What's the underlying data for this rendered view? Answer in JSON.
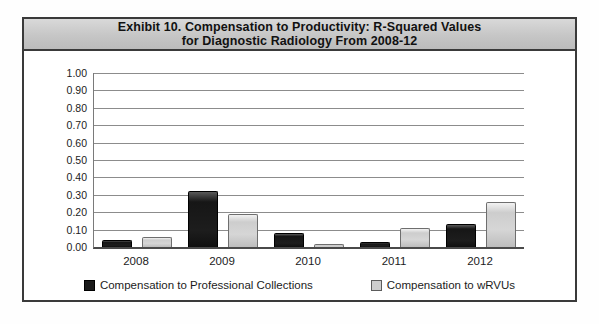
{
  "title": {
    "line1": "Exhibit 10. Compensation to Productivity: R-Squared Values",
    "line2": "for Diagnostic Radiology From 2008-12"
  },
  "chart_data": {
    "type": "bar",
    "categories": [
      "2008",
      "2009",
      "2010",
      "2011",
      "2012"
    ],
    "series": [
      {
        "name": "Compensation to Professional Collections",
        "color": "#1a1a1a",
        "values": [
          0.04,
          0.32,
          0.08,
          0.03,
          0.13
        ]
      },
      {
        "name": "Compensation to wRVUs",
        "color": "#cdcdcd",
        "values": [
          0.06,
          0.19,
          0.02,
          0.11,
          0.26
        ]
      }
    ],
    "ylabel": "",
    "xlabel": "",
    "ylim": [
      0.0,
      1.0
    ],
    "ytick_step": 0.1,
    "yticks": [
      "1.00",
      "0.90",
      "0.80",
      "0.70",
      "0.60",
      "0.50",
      "0.40",
      "0.30",
      "0.20",
      "0.10",
      "0.00"
    ],
    "grid": true,
    "legend_position": "bottom"
  }
}
